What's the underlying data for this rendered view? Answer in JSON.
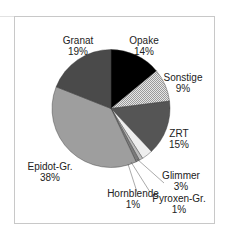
{
  "chart_data": {
    "type": "pie",
    "title": "",
    "start_angle": "12 o'clock",
    "direction": "clockwise",
    "slices": [
      {
        "label": "Opake",
        "value": 14,
        "pct_label": "14%",
        "fill": "#000000"
      },
      {
        "label": "Sonstige",
        "value": 9,
        "pct_label": "9%",
        "fill": "pattern-checker-light"
      },
      {
        "label": "ZRT",
        "value": 15,
        "pct_label": "15%",
        "fill": "#555555"
      },
      {
        "label": "Glimmer",
        "value": 3,
        "pct_label": "3%",
        "fill": "#eeeeee"
      },
      {
        "label": "Pyroxen-Gr.",
        "value": 1,
        "pct_label": "1%",
        "fill": "#bbbbbb"
      },
      {
        "label": "Hornblende",
        "value": 1,
        "pct_label": "1%",
        "fill": "#7a7a7a"
      },
      {
        "label": "Epidot-Gr.",
        "value": 38,
        "pct_label": "38%",
        "fill": "#9e9e9e"
      },
      {
        "label": "Granat",
        "value": 19,
        "pct_label": "19%",
        "fill": "#4a4a4a"
      }
    ],
    "legend": "none (data labels beside slices)"
  },
  "labels": {
    "opake": {
      "name": "Opake",
      "pct": "14%"
    },
    "sonstige": {
      "name": "Sonstige",
      "pct": "9%"
    },
    "zrt": {
      "name": "ZRT",
      "pct": "15%"
    },
    "glimmer": {
      "name": "Glimmer",
      "pct": "3%"
    },
    "pyroxen": {
      "name": "Pyroxen-Gr.",
      "pct": "1%"
    },
    "hornblende": {
      "name": "Hornblende",
      "pct": "1%"
    },
    "epidot": {
      "name": "Epidot-Gr.",
      "pct": "38%"
    },
    "granat": {
      "name": "Granat",
      "pct": "19%"
    }
  }
}
